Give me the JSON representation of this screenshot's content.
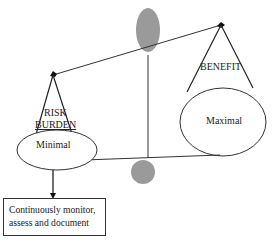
{
  "diagram": {
    "type": "balance-scale",
    "left_pan": {
      "heading_line1": "RISK",
      "heading_line2": "BURDEN",
      "value": "Minimal"
    },
    "right_pan": {
      "heading": "BENEFIT",
      "value": "Maximal"
    },
    "action_box": {
      "line1": "Continuously monitor,",
      "line2": "assess and document"
    },
    "colors": {
      "stroke": "#333333",
      "counterweight": "#9a9a9a",
      "background": "#ffffff"
    }
  }
}
